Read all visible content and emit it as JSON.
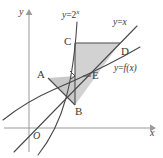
{
  "figure": {
    "type": "math-diagram",
    "axes": {
      "x_label": "x",
      "y_label": "y",
      "origin_label": "O"
    },
    "curve_labels": {
      "exponential": {
        "lhs": "y",
        "eq": "=",
        "base": "2",
        "exponent": "x"
      },
      "identity": {
        "lhs": "y",
        "eq": "=",
        "rhs": "x"
      },
      "inverse": {
        "lhs": "y",
        "eq": "=",
        "rhs": "f(x)"
      }
    },
    "points": [
      {
        "name": "A",
        "label": "A"
      },
      {
        "name": "B",
        "label": "B"
      },
      {
        "name": "C",
        "label": "C"
      },
      {
        "name": "D",
        "label": "D"
      },
      {
        "name": "E",
        "label": "E"
      }
    ],
    "colors": {
      "shade": "#d2d2d2",
      "stroke": "#4a4a4a",
      "axis": "#8a8a8a",
      "text": "#3a3a3a"
    }
  }
}
